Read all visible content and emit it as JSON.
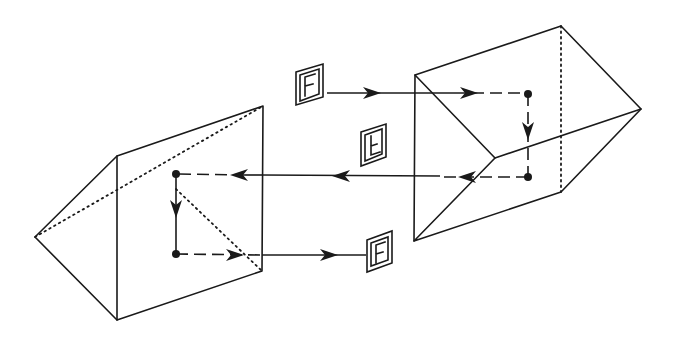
{
  "figure": {
    "colors": {
      "line": "#1a1a1a",
      "background": "#ffffff"
    }
  },
  "prisms": [
    {
      "id": "right-prism",
      "label": "Right-angle prism (right)"
    },
    {
      "id": "left-prism",
      "label": "Right-angle prism (left)"
    }
  ],
  "images": [
    {
      "id": "input-image",
      "glyph": "F",
      "orientation": "upright",
      "position": "top-center"
    },
    {
      "id": "intermediate-image",
      "glyph": "F",
      "orientation": "rotated 180° (inverted)",
      "position": "center"
    },
    {
      "id": "output-image",
      "glyph": "F",
      "orientation": "upright",
      "position": "bottom-center"
    }
  ],
  "rays": [
    {
      "id": "incoming-ray",
      "direction": "right",
      "into": "right-prism"
    },
    {
      "id": "internal-ray-right",
      "direction": "down",
      "within": "right-prism"
    },
    {
      "id": "transfer-ray",
      "direction": "left",
      "from": "right-prism",
      "into": "left-prism"
    },
    {
      "id": "internal-ray-left",
      "direction": "down",
      "within": "left-prism"
    },
    {
      "id": "outgoing-ray",
      "direction": "right",
      "from": "left-prism"
    }
  ]
}
